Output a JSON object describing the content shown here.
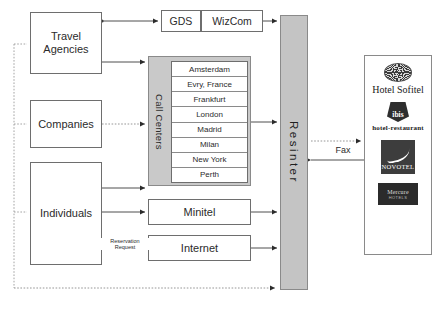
{
  "diagram": {
    "colors": {
      "panel_gray": "#c9c9c9",
      "resinter_gray": "#c4c4c4",
      "border": "#6e6e6e",
      "text": "#2b2b2b",
      "background": "#ffffff"
    }
  },
  "actors": {
    "travel_agencies": "Travel\nAgencies",
    "travel_agencies_line1": "Travel",
    "travel_agencies_line2": "Agencies",
    "companies": "Companies",
    "individuals": "Individuals"
  },
  "channels": {
    "gds": "GDS",
    "wizcom": "WizCom",
    "minitel": "Minitel",
    "internet": "Internet"
  },
  "call_centers": {
    "label": "Call Centers",
    "items": [
      "Amsterdam",
      "Evry, France",
      "Frankfurt",
      "London",
      "Madrid",
      "Milan",
      "New York",
      "Perth"
    ]
  },
  "hub": {
    "label": "Resinter"
  },
  "brands": {
    "sofitel": {
      "name": "Hotel Sofitel",
      "icon": "sofitel-sunburst-icon"
    },
    "ibis": {
      "name": "ibis",
      "tagline": "hotel-restaurant",
      "icon": "ibis-shield-icon"
    },
    "novotel": {
      "name": "NOVOTEL",
      "icon": "novotel-swoosh-icon"
    },
    "mercure": {
      "name": "Mercure",
      "tagline": "HOTELS",
      "icon": "mercure-logo-icon"
    }
  },
  "edge_labels": {
    "fax": "Fax",
    "reservation_request_line1": "Reservation",
    "reservation_request_line2": "Request"
  }
}
